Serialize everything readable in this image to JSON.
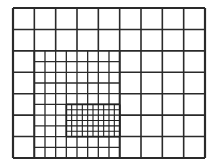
{
  "diagram": {
    "type": "adaptive-mesh-refinement-grid",
    "background": "#ffffff",
    "line_color": "#2a2a2a",
    "levels": [
      {
        "name": "coarse",
        "x": 13,
        "y": 8,
        "width": 192,
        "height": 150,
        "cols": 9,
        "rows": 7,
        "stroke_width": 1.6,
        "color": "#2a2a2a"
      },
      {
        "name": "medium",
        "x": 34.33,
        "y": 50.86,
        "width": 85.33,
        "height": 107.14,
        "cols": 8,
        "rows": 10,
        "stroke_width": 1.3,
        "color": "#2a2a2a"
      },
      {
        "name": "fine",
        "x": 66.33,
        "y": 104.43,
        "width": 53.33,
        "height": 32.14,
        "cols": 10,
        "rows": 6,
        "stroke_width": 1.1,
        "color": "#1e1e1e"
      }
    ]
  }
}
